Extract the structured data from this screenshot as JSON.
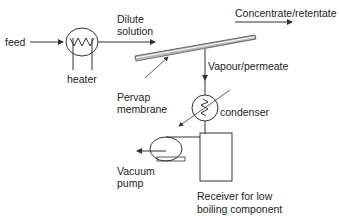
{
  "diagram": {
    "labels": {
      "feed": "feed",
      "heater": "heater",
      "dilute_line1": "Dilute",
      "dilute_line2": "solution",
      "concentrate": "Concentrate/retentate",
      "vapour": "Vapour/permeate",
      "membrane_line1": "Pervap",
      "membrane_line2": "membrane",
      "condenser": "condenser",
      "vacuum_line1": "Vacuum",
      "vacuum_line2": "pump",
      "receiver_line1": "Receiver for low",
      "receiver_line2": "boiling component"
    },
    "components": [
      "heater-icon",
      "membrane",
      "condenser-icon",
      "vacuum-pump-icon",
      "receiver-vessel"
    ],
    "colors": {
      "line": "#333333",
      "text": "#222222",
      "background": "#ffffff"
    }
  }
}
